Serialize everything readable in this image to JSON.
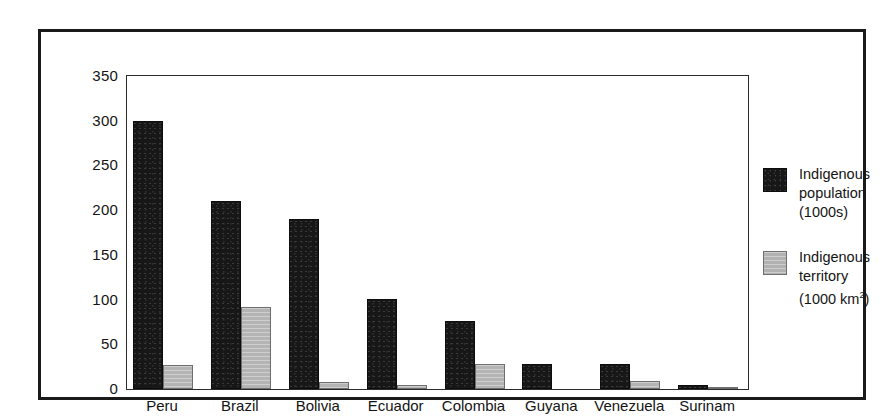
{
  "chart_data": {
    "type": "bar",
    "title": "",
    "subtitle": "",
    "xlabel": "",
    "ylabel": "",
    "ylim": [
      0,
      350
    ],
    "yticks": [
      0,
      50,
      100,
      150,
      200,
      250,
      300,
      350
    ],
    "grid": false,
    "legend_position": "right",
    "categories": [
      "Peru",
      "Brazil",
      "Bolivia",
      "Ecuador",
      "Colombia",
      "Guyana",
      "Venezuela",
      "Surinam"
    ],
    "series": [
      {
        "name": "Indigenous population (1000s)",
        "color": "#171717",
        "values": [
          300,
          210,
          190,
          101,
          76,
          28,
          28,
          5
        ]
      },
      {
        "name": "Indigenous territory (1000 km2)",
        "color": "#b4b4b4",
        "values": [
          27,
          92,
          8,
          5,
          28,
          0,
          9,
          1
        ]
      }
    ],
    "annotations": []
  },
  "legend": {
    "entries": [
      {
        "swatch": "black-swatch",
        "line1": "Indigenous",
        "line2": "population",
        "line3_prefix": "(1000s)",
        "line3_sup": "",
        "line3_suffix": ""
      },
      {
        "swatch": "gray-swatch",
        "line1": "Indigenous",
        "line2": "territory",
        "line3_prefix": "(1000 km",
        "line3_sup": "2",
        "line3_suffix": ")"
      }
    ]
  },
  "colors": {
    "population_bar": "#171717",
    "territory_bar": "#b4b4b4",
    "frame": "#1a1a1a",
    "plot_border": "#2b2b2b",
    "text": "#141414",
    "background": "#ffffff"
  }
}
